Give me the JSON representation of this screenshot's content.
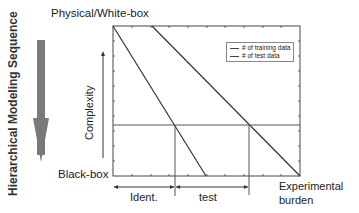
{
  "diagram": {
    "top_label": "Physical/White-box",
    "bottom_label": "Black-box",
    "vertical_title": "Hierarchical Modeling Sequence",
    "y_axis_label": "Complexity",
    "x_axis_label_line1": "Experimental",
    "x_axis_label_line2": "burden",
    "segment_ident": "Ident.",
    "segment_test": "test",
    "legend": [
      {
        "label": "# of training data"
      },
      {
        "label": "# of test data"
      }
    ],
    "colors": {
      "arrow": "#777777",
      "lines": "#333333",
      "frame": "#444444"
    }
  }
}
